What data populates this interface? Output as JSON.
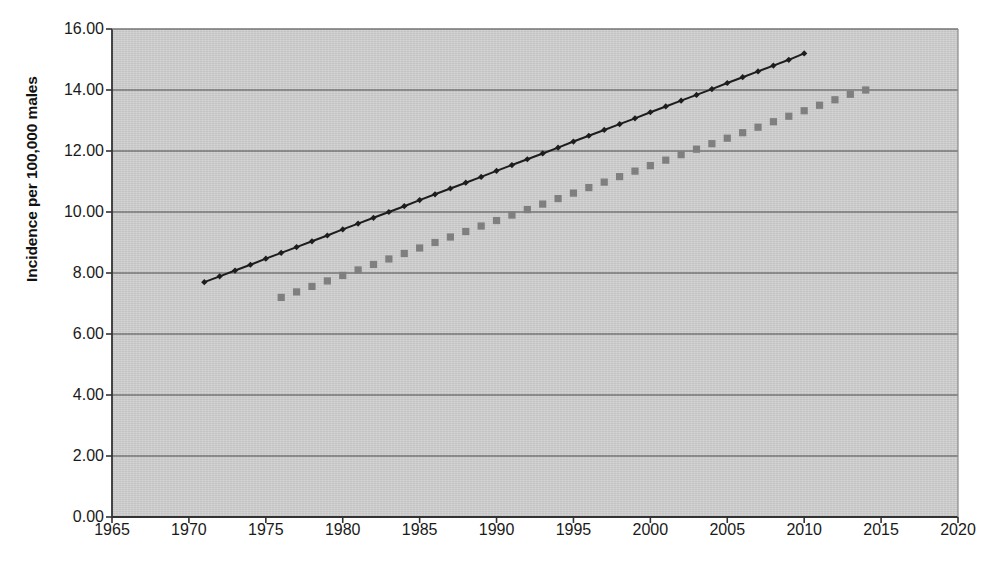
{
  "chart_data": {
    "type": "line",
    "title": "",
    "xlabel": "",
    "ylabel": "Incidence per 100,000 males",
    "xlim": [
      1965,
      2020
    ],
    "ylim": [
      0,
      16
    ],
    "grid": "horizontal",
    "legend": "none",
    "plot_background": "#c9c9c9",
    "xticks": [
      "1965",
      "1970",
      "1975",
      "1980",
      "1985",
      "1990",
      "1995",
      "2000",
      "2005",
      "2010",
      "2015",
      "2020"
    ],
    "yticks": [
      "0.00",
      "2.00",
      "4.00",
      "6.00",
      "8.00",
      "10.00",
      "12.00",
      "14.00",
      "16.00"
    ],
    "series": [
      {
        "name": "series-dark-diamond",
        "color": "#1d1d1d",
        "marker": "diamond",
        "line": "solid",
        "x": [
          1971,
          1972,
          1973,
          1974,
          1975,
          1976,
          1977,
          1978,
          1979,
          1980,
          1981,
          1982,
          1983,
          1984,
          1985,
          1986,
          1987,
          1988,
          1989,
          1990,
          1991,
          1992,
          1993,
          1994,
          1995,
          1996,
          1997,
          1998,
          1999,
          2000,
          2001,
          2002,
          2003,
          2004,
          2005,
          2006,
          2007,
          2008,
          2009,
          2010
        ],
        "values": [
          7.7,
          7.89,
          8.08,
          8.27,
          8.47,
          8.66,
          8.85,
          9.04,
          9.23,
          9.43,
          9.62,
          9.81,
          10.0,
          10.19,
          10.39,
          10.58,
          10.77,
          10.96,
          11.15,
          11.35,
          11.54,
          11.73,
          11.92,
          12.11,
          12.31,
          12.5,
          12.69,
          12.88,
          13.07,
          13.27,
          13.46,
          13.65,
          13.84,
          14.03,
          14.23,
          14.42,
          14.61,
          14.8,
          14.99,
          15.2
        ]
      },
      {
        "name": "series-gray-square",
        "color": "#7f7f7f",
        "marker": "square",
        "line": "none",
        "x": [
          1976,
          1977,
          1978,
          1979,
          1980,
          1981,
          1982,
          1983,
          1984,
          1985,
          1986,
          1987,
          1988,
          1989,
          1990,
          1991,
          1992,
          1993,
          1994,
          1995,
          1996,
          1997,
          1998,
          1999,
          2000,
          2001,
          2002,
          2003,
          2004,
          2005,
          2006,
          2007,
          2008,
          2009,
          2010,
          2011,
          2012,
          2013,
          2014
        ],
        "values": [
          7.2,
          7.38,
          7.56,
          7.74,
          7.92,
          8.1,
          8.28,
          8.46,
          8.64,
          8.82,
          9.0,
          9.18,
          9.36,
          9.54,
          9.72,
          9.9,
          10.08,
          10.26,
          10.44,
          10.62,
          10.8,
          10.98,
          11.16,
          11.34,
          11.52,
          11.7,
          11.88,
          12.06,
          12.24,
          12.42,
          12.6,
          12.78,
          12.96,
          13.14,
          13.32,
          13.5,
          13.68,
          13.86,
          14.0
        ]
      }
    ]
  },
  "watermark": {
    "top_text": "bleed-through text",
    "side_text": "bleed-through"
  }
}
